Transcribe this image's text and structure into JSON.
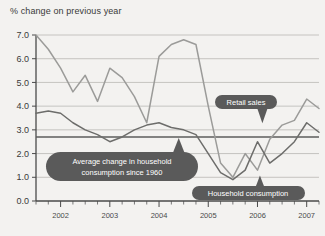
{
  "chart_data": {
    "type": "line",
    "title": "% change on previous year",
    "xlabel": "",
    "ylabel": "",
    "ylim": [
      0.0,
      7.0
    ],
    "xlim": [
      2001.5,
      2007.25
    ],
    "grid": true,
    "legend_position": "inline-callouts",
    "ytick_labels": [
      "0.0",
      "1.0",
      "2.0",
      "3.0",
      "4.0",
      "5.0",
      "6.0",
      "7.0"
    ],
    "ytick_values": [
      0.0,
      1.0,
      2.0,
      3.0,
      4.0,
      5.0,
      6.0,
      7.0
    ],
    "xtick_labels": [
      "2002",
      "2003",
      "2004",
      "2005",
      "2006",
      "2007"
    ],
    "xtick_values": [
      2002,
      2003,
      2004,
      2005,
      2006,
      2007
    ],
    "x": [
      2001.5,
      2001.75,
      2002.0,
      2002.25,
      2002.5,
      2002.75,
      2003.0,
      2003.25,
      2003.5,
      2003.75,
      2004.0,
      2004.25,
      2004.5,
      2004.75,
      2005.0,
      2005.25,
      2005.5,
      2005.75,
      2006.0,
      2006.25,
      2006.5,
      2006.75,
      2007.0,
      2007.25
    ],
    "series": [
      {
        "name": "Retail sales",
        "color": "#9b9b99",
        "values": [
          7.0,
          6.4,
          5.6,
          4.6,
          5.3,
          4.2,
          5.6,
          5.2,
          4.4,
          3.3,
          6.1,
          6.6,
          6.8,
          6.6,
          4.0,
          1.6,
          1.0,
          2.0,
          1.3,
          2.6,
          3.2,
          3.4,
          4.3,
          3.9
        ]
      },
      {
        "name": "Household consumption",
        "color": "#6d6d6b",
        "values": [
          3.7,
          3.8,
          3.7,
          3.3,
          3.0,
          2.8,
          2.5,
          2.7,
          3.0,
          3.2,
          3.3,
          3.1,
          3.0,
          2.8,
          2.0,
          1.2,
          0.9,
          1.3,
          2.5,
          1.6,
          2.0,
          2.5,
          3.3,
          2.9
        ]
      }
    ],
    "reference_line": {
      "label": "Average change in household consumption since 1960",
      "value": 2.7,
      "color": "#5c5c5c"
    },
    "annotations": [
      {
        "name": "retail-sales-callout",
        "text": "Retail sales",
        "points_to_x": 2006.1,
        "points_to_y": 3.45
      },
      {
        "name": "household-consumption-callout",
        "text": "Household consumption",
        "points_to_x": 2006.05,
        "points_to_y": 0.95
      },
      {
        "name": "average-line-callout",
        "line1": "Average change in household",
        "line2": "consumption since 1960",
        "points_to_x": 2004.4,
        "points_to_y": 2.7
      }
    ]
  }
}
